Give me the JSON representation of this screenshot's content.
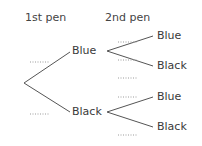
{
  "headers": {
    "first": "1st pen",
    "second": "2nd pen"
  },
  "first_level": [
    {
      "label": "Blue",
      "probability_blank": "......."
    },
    {
      "label": "Black",
      "probability_blank": "......."
    }
  ],
  "second_level": {
    "from_blue": [
      {
        "label": "Blue",
        "probability_blank": "......."
      },
      {
        "label": "Black",
        "probability_blank": "......."
      }
    ],
    "from_black": [
      {
        "label": "Blue",
        "probability_blank": "......."
      },
      {
        "label": "Black",
        "probability_blank": "......."
      }
    ]
  },
  "colors": {
    "line": "#555555",
    "dots": "#9a9a9a",
    "text": "#3a3a3a"
  }
}
